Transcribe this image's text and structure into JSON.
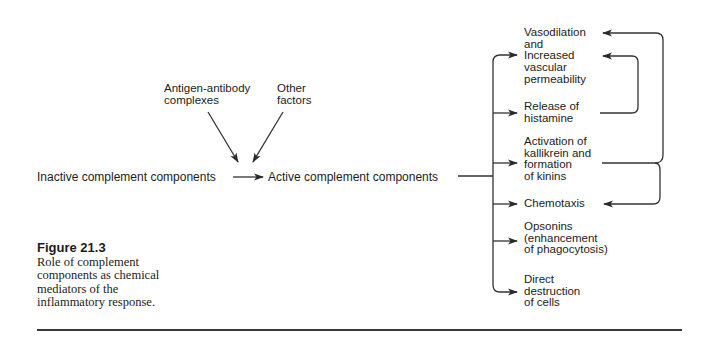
{
  "figure": {
    "number": "Figure 21.3",
    "caption": "Role of complement\ncomponents as chemical\nmediators of the\ninflammatory response."
  },
  "inputs": {
    "antigen_antibody": "Antigen-antibody\ncomplexes",
    "other_factors": "Other\nfactors"
  },
  "pathway": {
    "inactive": "Inactive complement components",
    "active": "Active complement components"
  },
  "effects": [
    {
      "id": "vasodilation",
      "label": "Vasodilation\nand\nIncreased\nvascular\npermeability"
    },
    {
      "id": "histamine",
      "label": "Release of\nhistamine"
    },
    {
      "id": "kallikrein",
      "label": "Activation of\nkallikrein and\nformation\nof kinins"
    },
    {
      "id": "chemotaxis",
      "label": "Chemotaxis"
    },
    {
      "id": "opsonins",
      "label": "Opsonins\n(enhancement\nof phagocytosis)"
    },
    {
      "id": "destruction",
      "label": "Direct\ndestruction\nof cells"
    }
  ],
  "edges": [
    {
      "from": "Antigen-antibody complexes",
      "to": "activation step"
    },
    {
      "from": "Other factors",
      "to": "activation step"
    },
    {
      "from": "Inactive complement components",
      "to": "Active complement components"
    },
    {
      "from": "Active complement components",
      "to": "Increased vascular permeability"
    },
    {
      "from": "Active complement components",
      "to": "Release of histamine"
    },
    {
      "from": "Active complement components",
      "to": "Activation of kallikrein and formation of kinins"
    },
    {
      "from": "Active complement components",
      "to": "Chemotaxis"
    },
    {
      "from": "Active complement components",
      "to": "Opsonins (enhancement of phagocytosis)"
    },
    {
      "from": "Active complement components",
      "to": "Direct destruction of cells"
    },
    {
      "from": "Release of histamine",
      "to": "Increased vascular permeability"
    },
    {
      "from": "Activation of kallikrein and formation of kinins",
      "to": "Vasodilation"
    },
    {
      "from": "Activation of kallikrein and formation of kinins",
      "to": "Chemotaxis"
    }
  ],
  "colors": {
    "text": "#1c1c1c",
    "lines": "#333333",
    "background": "#ffffff"
  }
}
